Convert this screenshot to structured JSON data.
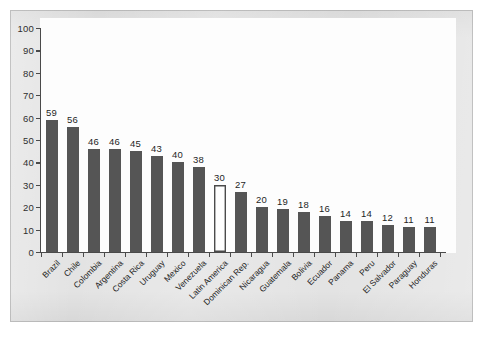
{
  "chart_data": {
    "type": "bar",
    "title": "",
    "subtitle": "",
    "xlabel": "",
    "ylabel": "",
    "ylim": [
      0,
      100
    ],
    "yticks": [
      0,
      10,
      20,
      30,
      40,
      50,
      60,
      70,
      80,
      90,
      100
    ],
    "grid": false,
    "legend": null,
    "categories": [
      "Brazil",
      "Chile",
      "Colombia",
      "Argentina",
      "Costa Rica",
      "Uruguay",
      "Mexico",
      "Venezuela",
      "Latin America",
      "Dominican Rep.",
      "Nicaragua",
      "Guatemala",
      "Bolivia",
      "Ecuador",
      "Panama",
      "Peru",
      "El Salvador",
      "Paraguay",
      "Honduras"
    ],
    "values": [
      59,
      56,
      46,
      46,
      45,
      43,
      40,
      38,
      30,
      27,
      20,
      19,
      18,
      16,
      14,
      14,
      12,
      11,
      11
    ],
    "highlight_index": 8,
    "highlight_style": "white-fill-dark-outline",
    "colors": {
      "bar": "#555555",
      "highlight_fill": "#fdfdfd",
      "highlight_stroke": "#4a4a4a",
      "axis": "#4a4a4a",
      "plot_background": "#fdfdfd",
      "page_background": "#e3e3e3",
      "text": "#1f1f1f"
    }
  }
}
